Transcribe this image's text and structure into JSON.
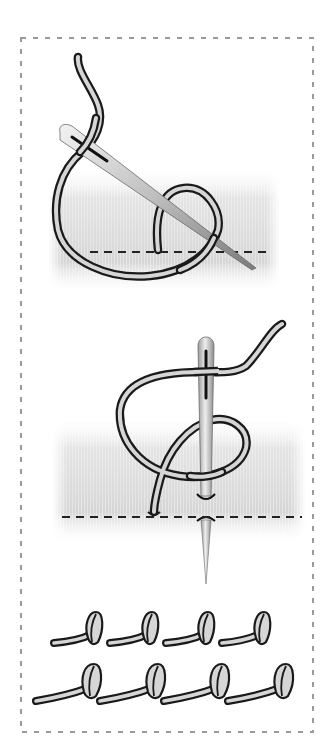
{
  "figure": {
    "title": "Knot stitch instructions",
    "panels": [
      {
        "id": "step-1",
        "label": "Wrap thread around needle"
      },
      {
        "id": "step-2",
        "label": "Insert needle through fabric"
      },
      {
        "id": "step-3",
        "label": "Finished knot stitch rows"
      }
    ],
    "result_rows": [
      {
        "row": 1,
        "knot_count": 4
      },
      {
        "row": 2,
        "knot_count": 4
      }
    ]
  },
  "colors": {
    "background": "#ffffff",
    "frame_dash": "#9a9a9a",
    "thread_fill": "#d6d6d6",
    "thread_outline": "#1a1a1a",
    "needle_light": "#e8e8e8",
    "needle_dark": "#8a8a8a",
    "fabric": "#dcdcdc",
    "stitch_line": "#222222"
  }
}
